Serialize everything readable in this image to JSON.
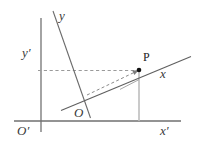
{
  "figure": {
    "background_color": "#ffffff",
    "width": 203,
    "height": 145,
    "labels": {
      "y_prime": "y′",
      "y": "y",
      "x_prime": "x′",
      "x": "x",
      "origin_prime": "O′",
      "origin": "O",
      "point_p": "P"
    },
    "colors": {
      "axis_primary": "#6f6f6f",
      "axis_secondary": "#7a7a7a",
      "dashed": "#8a8a8a",
      "guide": "#b0b0b0",
      "point": "#111111",
      "label": "#3a3a3a"
    },
    "geometry": {
      "y_prime_axis": {
        "x1": 41,
        "y1": 18,
        "x2": 41,
        "y2": 132
      },
      "x_prime_axis": {
        "x1": 14,
        "y1": 121,
        "x2": 181,
        "y2": 121
      },
      "y_axis": {
        "x1": 53,
        "y1": 11,
        "x2": 90,
        "y2": 118
      },
      "x_axis": {
        "x1": 62,
        "y1": 110,
        "x2": 191,
        "y2": 57
      },
      "origin_local": {
        "x": 84,
        "y": 102
      },
      "point_p": {
        "x": 139,
        "y": 70
      },
      "dashed_horizontal": {
        "x1": 38,
        "y1": 70,
        "x2": 139,
        "y2": 70
      },
      "dashed_vector": {
        "x1": 87,
        "y1": 95,
        "x2": 137,
        "y2": 71
      },
      "guide_vertical": {
        "x1": 139,
        "y1": 72,
        "x2": 139,
        "y2": 121
      },
      "projection_tick": {
        "x1": 121,
        "y1": 89,
        "x2": 139,
        "y2": 79
      }
    }
  }
}
